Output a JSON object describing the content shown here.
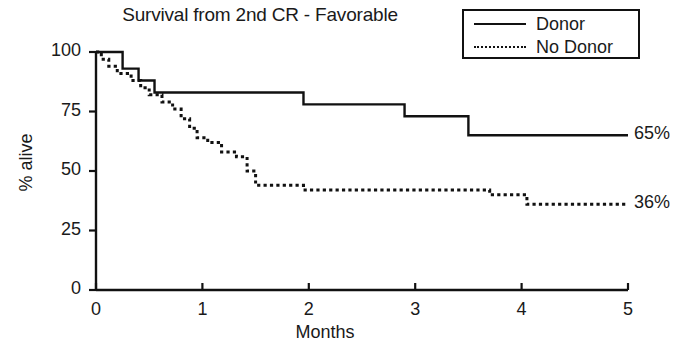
{
  "chart_data": {
    "type": "line",
    "title": "Survival from 2nd CR - Favorable",
    "xlabel": "Months",
    "ylabel": "% alive",
    "xlim": [
      0,
      5
    ],
    "ylim": [
      0,
      100
    ],
    "xticks": [
      "0",
      "1",
      "2",
      "3",
      "4",
      "5"
    ],
    "xtick_values": [
      0,
      1,
      2,
      3,
      4,
      5
    ],
    "yticks": [
      "0",
      "25",
      "50",
      "75",
      "100"
    ],
    "ytick_values": [
      0,
      25,
      50,
      75,
      100
    ],
    "grid": false,
    "legend_position": "top-right",
    "legend": [
      {
        "label": "Donor",
        "style": "solid"
      },
      {
        "label": "No Donor",
        "style": "dotted"
      }
    ],
    "annotations": [
      {
        "text": "65%",
        "x": 5.0,
        "y": 65,
        "series": "Donor"
      },
      {
        "text": "36%",
        "x": 5.0,
        "y": 36,
        "series": "No Donor"
      }
    ],
    "series": [
      {
        "name": "Donor",
        "style": "solid",
        "step": "post",
        "points": [
          [
            0.0,
            100
          ],
          [
            0.25,
            100
          ],
          [
            0.25,
            93
          ],
          [
            0.4,
            93
          ],
          [
            0.4,
            88
          ],
          [
            0.55,
            88
          ],
          [
            0.55,
            83
          ],
          [
            1.95,
            83
          ],
          [
            1.95,
            78
          ],
          [
            2.9,
            78
          ],
          [
            2.9,
            73
          ],
          [
            3.5,
            73
          ],
          [
            3.5,
            65
          ],
          [
            5.0,
            65
          ]
        ]
      },
      {
        "name": "No Donor",
        "style": "dotted",
        "step": "post",
        "points": [
          [
            0.0,
            100
          ],
          [
            0.05,
            100
          ],
          [
            0.05,
            97
          ],
          [
            0.12,
            97
          ],
          [
            0.12,
            94
          ],
          [
            0.2,
            94
          ],
          [
            0.2,
            91
          ],
          [
            0.33,
            91
          ],
          [
            0.33,
            88
          ],
          [
            0.42,
            88
          ],
          [
            0.42,
            85
          ],
          [
            0.5,
            85
          ],
          [
            0.5,
            82
          ],
          [
            0.62,
            82
          ],
          [
            0.62,
            79
          ],
          [
            0.72,
            79
          ],
          [
            0.72,
            76
          ],
          [
            0.8,
            76
          ],
          [
            0.8,
            72
          ],
          [
            0.88,
            72
          ],
          [
            0.88,
            68
          ],
          [
            0.95,
            68
          ],
          [
            0.95,
            64
          ],
          [
            1.05,
            64
          ],
          [
            1.05,
            62
          ],
          [
            1.18,
            62
          ],
          [
            1.18,
            58
          ],
          [
            1.32,
            58
          ],
          [
            1.32,
            56
          ],
          [
            1.42,
            56
          ],
          [
            1.42,
            50
          ],
          [
            1.5,
            50
          ],
          [
            1.5,
            44
          ],
          [
            1.95,
            44
          ],
          [
            1.95,
            42
          ],
          [
            3.7,
            42
          ],
          [
            3.7,
            40
          ],
          [
            4.05,
            40
          ],
          [
            4.05,
            36
          ],
          [
            5.0,
            36
          ]
        ]
      }
    ]
  },
  "figure": {
    "title": "Survival from 2nd CR - Favorable",
    "axis_x_label": "Months",
    "axis_y_label": "% alive"
  }
}
